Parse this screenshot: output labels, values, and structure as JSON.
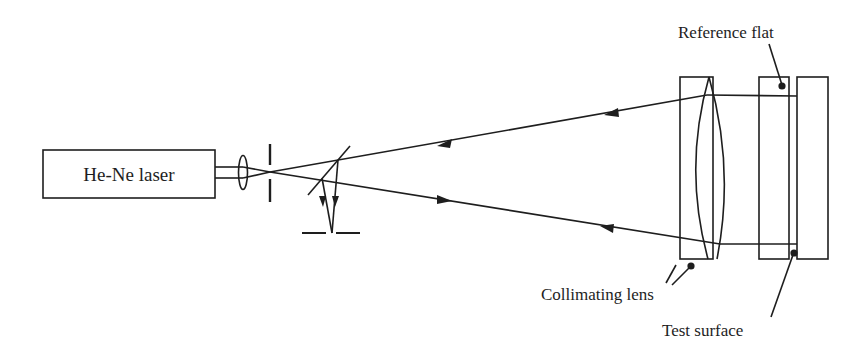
{
  "diagram": {
    "type": "optical-setup",
    "stroke_color": "#1e1e1e",
    "background": "#ffffff",
    "labels": {
      "laser": "He-Ne laser",
      "reference_flat": "Reference flat",
      "collimating_lens": "Collimating lens",
      "test_surface": "Test surface"
    },
    "components": [
      {
        "id": "laser",
        "label": "He-Ne laser"
      },
      {
        "id": "focusing-lens",
        "label": ""
      },
      {
        "id": "pinhole",
        "label": ""
      },
      {
        "id": "beam-splitter",
        "label": ""
      },
      {
        "id": "detector",
        "label": ""
      },
      {
        "id": "collimating-lens",
        "label": "Collimating lens"
      },
      {
        "id": "reference-flat",
        "label": "Reference flat"
      },
      {
        "id": "test-surface",
        "label": "Test surface"
      }
    ]
  }
}
